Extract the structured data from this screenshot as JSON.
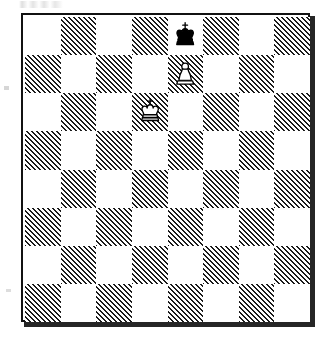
{
  "diagram": {
    "type": "chess-board-diagram",
    "board_size": 8,
    "orientation": "white-bottom",
    "files": [
      "a",
      "b",
      "c",
      "d",
      "e",
      "f",
      "g",
      "h"
    ],
    "ranks": [
      "8",
      "7",
      "6",
      "5",
      "4",
      "3",
      "2",
      "1"
    ],
    "dark_square_style": "diagonal-hatching-45deg",
    "a1_square_color": "dark",
    "coordinates_shown": false,
    "border": "black-rule-with-drop-shadow",
    "colors": {
      "light_square": "#ffffff",
      "dark_square_hatch": "#1b1b1b",
      "border": "#111111",
      "shadow": "#262626",
      "piece_outline": "#000000",
      "white_piece_fill": "#ffffff",
      "black_piece_fill": "#000000",
      "background": "#ffffff"
    },
    "pieces": [
      {
        "id": "black-king-e8",
        "piece": "king",
        "color": "black",
        "square": "e8",
        "file_index": 4,
        "rank_index": 0,
        "glyph": "♚",
        "label": "Black King"
      },
      {
        "id": "white-pawn-e7",
        "piece": "pawn",
        "color": "white",
        "square": "e7",
        "file_index": 4,
        "rank_index": 1,
        "glyph": "♙",
        "label": "White Pawn"
      },
      {
        "id": "white-king-d6",
        "piece": "king",
        "color": "white",
        "square": "d6",
        "file_index": 3,
        "rank_index": 2,
        "glyph": "♔",
        "label": "White King"
      }
    ],
    "fen": "4k3/4P3/3K4/8/8/8/8/8 w - -",
    "position_summary": "Black king e8, White pawn e7, White king d6"
  },
  "artifacts": {
    "top_smudge": "scan-smudge",
    "left_speck": "scan-speck",
    "bottom_speck": "scan-speck"
  }
}
